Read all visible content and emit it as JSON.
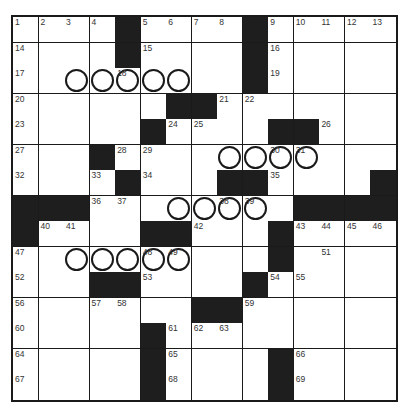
{
  "puzzle": {
    "size": 15,
    "colors": {
      "block": "#1e1e1e",
      "line": "#1a1a1a",
      "cell": "#ffffff",
      "number": "#333333"
    },
    "rows": [
      "....#....#.....",
      "....#....#.....",
      ".........#.....",
      "......##.......",
      ".....#....##...",
      "...#...........",
      "....#...##....#",
      "###........####",
      "#....##...#....",
      "..........#....",
      "...##....#.....",
      ".......##......",
      ".....#.........",
      ".....#....#....",
      ".....#....#...."
    ],
    "numbers": [
      [
        1,
        2,
        3,
        4,
        0,
        5,
        6,
        7,
        8,
        0,
        9,
        10,
        11,
        12,
        13
      ],
      [
        14,
        0,
        0,
        0,
        0,
        15,
        0,
        0,
        0,
        0,
        16,
        0,
        0,
        0,
        0
      ],
      [
        17,
        0,
        0,
        0,
        18,
        0,
        0,
        0,
        0,
        0,
        19,
        0,
        0,
        0,
        0
      ],
      [
        20,
        0,
        0,
        0,
        0,
        0,
        0,
        0,
        21,
        22,
        0,
        0,
        0,
        0,
        0
      ],
      [
        23,
        0,
        0,
        0,
        0,
        0,
        24,
        25,
        0,
        0,
        0,
        0,
        26,
        0,
        0
      ],
      [
        27,
        0,
        0,
        0,
        28,
        29,
        0,
        0,
        0,
        0,
        30,
        31,
        0,
        0,
        0
      ],
      [
        32,
        0,
        0,
        33,
        0,
        34,
        0,
        0,
        0,
        0,
        35,
        0,
        0,
        0,
        0
      ],
      [
        0,
        0,
        0,
        36,
        37,
        0,
        0,
        0,
        38,
        39,
        0,
        0,
        0,
        0,
        0
      ],
      [
        0,
        40,
        41,
        0,
        0,
        0,
        0,
        42,
        0,
        0,
        0,
        43,
        44,
        45,
        46
      ],
      [
        47,
        0,
        0,
        0,
        0,
        48,
        49,
        0,
        0,
        0,
        50,
        0,
        51,
        0,
        0
      ],
      [
        52,
        0,
        0,
        0,
        0,
        53,
        0,
        0,
        0,
        0,
        54,
        55,
        0,
        0,
        0
      ],
      [
        56,
        0,
        0,
        57,
        58,
        0,
        0,
        0,
        0,
        59,
        0,
        0,
        0,
        0,
        0
      ],
      [
        60,
        0,
        0,
        0,
        0,
        0,
        61,
        62,
        63,
        0,
        0,
        0,
        0,
        0,
        0
      ],
      [
        64,
        0,
        0,
        0,
        0,
        0,
        65,
        0,
        0,
        0,
        0,
        66,
        0,
        0,
        0
      ],
      [
        67,
        0,
        0,
        0,
        0,
        0,
        68,
        0,
        0,
        0,
        0,
        69,
        0,
        0,
        0
      ]
    ],
    "circles": [
      [
        2,
        2
      ],
      [
        2,
        3
      ],
      [
        2,
        4
      ],
      [
        2,
        5
      ],
      [
        2,
        6
      ],
      [
        5,
        8
      ],
      [
        5,
        9
      ],
      [
        5,
        10
      ],
      [
        5,
        11
      ],
      [
        7,
        6
      ],
      [
        7,
        7
      ],
      [
        7,
        8
      ],
      [
        7,
        9
      ],
      [
        9,
        2
      ],
      [
        9,
        3
      ],
      [
        9,
        4
      ],
      [
        9,
        5
      ],
      [
        9,
        6
      ]
    ]
  }
}
